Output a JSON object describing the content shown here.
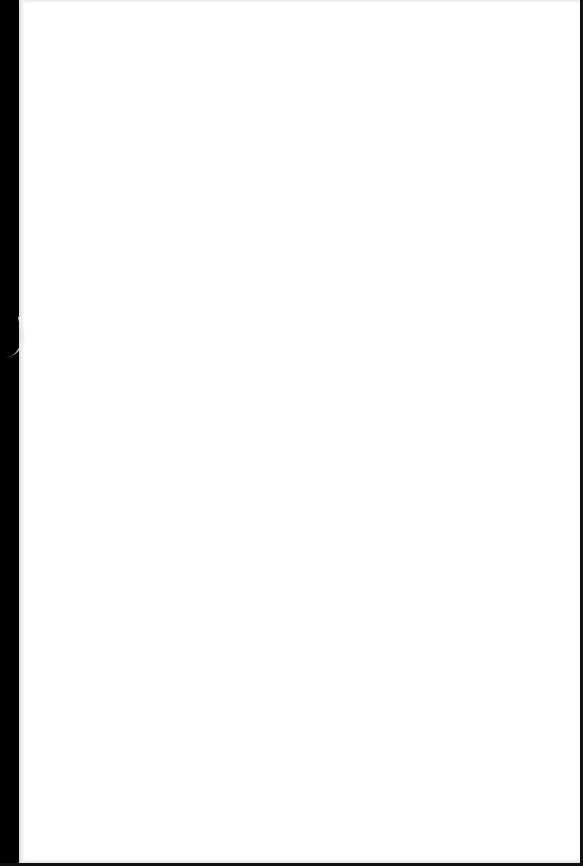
{
  "document": {
    "type": "scanned-page",
    "content_text": "",
    "page_color": "#ffffff",
    "background_color": "#000000"
  }
}
